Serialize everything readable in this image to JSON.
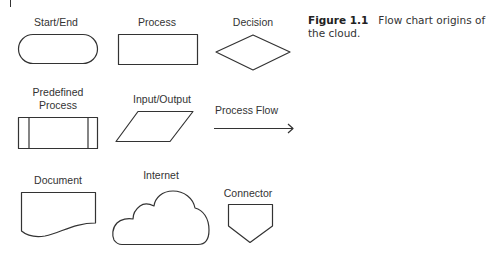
{
  "caption": {
    "label": "Figure 1.1",
    "text": "Flow chart origins of the cloud."
  },
  "symbols": [
    {
      "name": "start-end",
      "label": "Start/End"
    },
    {
      "name": "process",
      "label": "Process"
    },
    {
      "name": "decision",
      "label": "Decision"
    },
    {
      "name": "predefined-process",
      "label_line1": "Predefined",
      "label_line2": "Process"
    },
    {
      "name": "input-output",
      "label": "Input/Output"
    },
    {
      "name": "process-flow",
      "label": "Process Flow"
    },
    {
      "name": "document",
      "label": "Document"
    },
    {
      "name": "internet",
      "label": "Internet"
    },
    {
      "name": "connector",
      "label": "Connector"
    }
  ],
  "colors": {
    "stroke": "#333333",
    "text": "#333333",
    "background": "#ffffff"
  }
}
